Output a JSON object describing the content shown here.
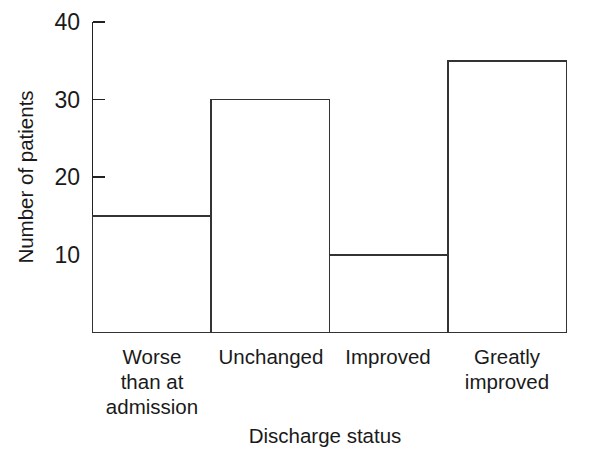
{
  "chart_data": {
    "type": "bar",
    "title": "",
    "subtitle": "",
    "xlabel": "Discharge status",
    "ylabel": "Number of patients",
    "categories": [
      "Worse\nthan at\nadmission",
      "Unchanged",
      "Improved",
      "Greatly\nimproved"
    ],
    "category_lines": [
      [
        "Worse",
        "than at",
        "admission"
      ],
      [
        "Unchanged"
      ],
      [
        "Improved"
      ],
      [
        "Greatly",
        "improved"
      ]
    ],
    "values": [
      15,
      30,
      10,
      35
    ],
    "ylim": [
      0,
      40
    ],
    "xlim": [
      0,
      4
    ],
    "yticks": [
      10,
      20,
      30,
      40
    ],
    "ytick_labels": [
      "10",
      "20",
      "30",
      "40"
    ],
    "grid": false,
    "legend": false,
    "legend_position": "none",
    "bar_style": "outline",
    "bar_gap": 0,
    "colors": {
      "background": "#ffffff",
      "axis": "#222222",
      "bar_stroke": "#333333",
      "bar_fill": "#ffffff",
      "text": "#1a1a1a"
    }
  },
  "y_tick_values": {
    "t0": "10",
    "t1": "20",
    "t2": "30",
    "t3": "40"
  },
  "category_labels": {
    "c0_l0": "Worse",
    "c0_l1": "than at",
    "c0_l2": "admission",
    "c1_l0": "Unchanged",
    "c2_l0": "Improved",
    "c3_l0": "Greatly",
    "c3_l1": "improved"
  },
  "axis_titles": {
    "x": "Discharge status",
    "y": "Number of patients"
  }
}
